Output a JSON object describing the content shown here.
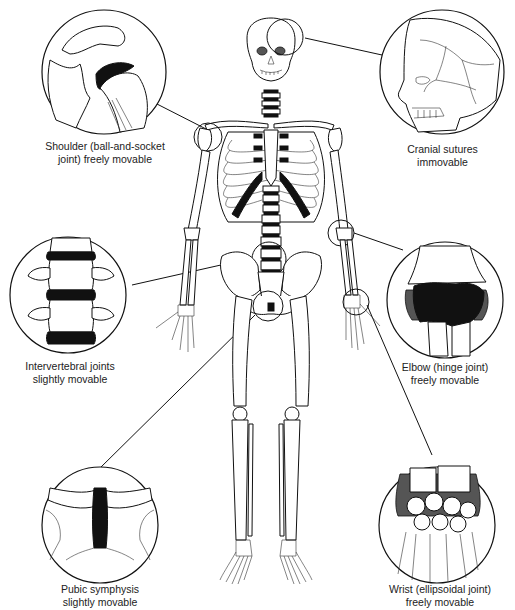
{
  "figure": {
    "colors": {
      "line": "#111111",
      "cartilage": "#111111",
      "background": "#ffffff"
    }
  },
  "callouts": [
    {
      "id": "shoulder",
      "line1": "Shoulder (ball-and-socket",
      "line2": "joint) freely movable",
      "joint_type": "ball-and-socket",
      "mobility": "freely movable"
    },
    {
      "id": "cranial",
      "line1": "Cranial sutures",
      "line2": "immovable",
      "joint_type": "suture",
      "mobility": "immovable"
    },
    {
      "id": "intervertebral",
      "line1": "Intervertebral joints",
      "line2": "slightly movable",
      "joint_type": "cartilaginous",
      "mobility": "slightly movable"
    },
    {
      "id": "elbow",
      "line1": "Elbow (hinge joint)",
      "line2": "freely movable",
      "joint_type": "hinge",
      "mobility": "freely movable"
    },
    {
      "id": "pubic",
      "line1": "Pubic symphysis",
      "line2": "slightly movable",
      "joint_type": "symphysis",
      "mobility": "slightly movable"
    },
    {
      "id": "wrist",
      "line1": "Wrist (ellipsoidal joint)",
      "line2": "freely movable",
      "joint_type": "ellipsoidal",
      "mobility": "freely movable"
    }
  ]
}
